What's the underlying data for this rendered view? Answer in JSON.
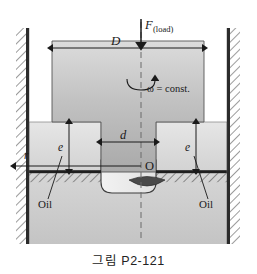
{
  "figure": {
    "caption": "그림 P2-121",
    "labels": {
      "diameter_outer": "D",
      "force": "F",
      "force_subscript": "(load)",
      "omega": "ω = const.",
      "diameter_inner": "d",
      "gap_left": "e",
      "gap_right": "e",
      "origin": "O",
      "radius": "r",
      "oil_left": "Oil",
      "oil_right": "Oil"
    },
    "colors": {
      "block_fill_light": "#d8d8d8",
      "block_fill_dark": "#a8a8a8",
      "shoulder_fill": "#e0e0e0",
      "ground_fill": "#cfcfcf",
      "wall_bar": "#2b2b2b",
      "hatch_stroke": "#3a3a3a",
      "line_stroke": "#1a1a1a",
      "lens_fill": "#4a4a4a",
      "axis_dash": "#6a6a6a",
      "background": "#ffffff"
    }
  }
}
